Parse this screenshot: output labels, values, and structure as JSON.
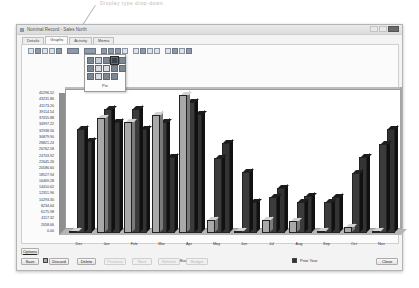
{
  "callout": {
    "text": "Display type drop-down"
  },
  "window": {
    "title": "Nominal Record - Sales North"
  },
  "tabs": [
    {
      "label": "Details",
      "active": false
    },
    {
      "label": "Graphs",
      "active": true
    },
    {
      "label": "Activity",
      "active": false
    },
    {
      "label": "Memo",
      "active": false
    }
  ],
  "toolbar": {
    "groups": [
      [
        "print-icon",
        "save-icon",
        "copy-icon",
        "cut-icon",
        "export-icon"
      ],
      [
        "chart-type-dropdown"
      ],
      [
        "color-dropdown"
      ],
      [
        "rotate-icon",
        "3d-icon",
        "grid-icon",
        "zoom-icon"
      ],
      [
        "legend-icon",
        "table-icon",
        "axis-icon",
        "label-icon"
      ],
      [
        "title-icon",
        "font-icon",
        "filter-icon",
        "properties-icon"
      ]
    ]
  },
  "chart_type_menu": {
    "hovered_label": "Pie",
    "items": [
      "bar-chart",
      "line-chart",
      "area-chart",
      "pie-chart",
      "3d-bar-chart",
      "stacked-bar-chart",
      "scatter-chart",
      "step-chart",
      "doughnut-chart",
      "column-chart",
      "gantt-chart",
      "step-line-chart",
      "hilo-chart",
      "polar-chart"
    ]
  },
  "chart_data": {
    "type": "bar",
    "title": "",
    "xlabel": "",
    "ylabel": "",
    "ylim": [
      0,
      45296.52
    ],
    "grid": false,
    "legend_position": "bottom",
    "yticks": [
      "45296.52",
      "43231.86",
      "41173.20",
      "39114.54",
      "37055.88",
      "34997.22",
      "32938.56",
      "30879.90",
      "28821.24",
      "26762.58",
      "24703.92",
      "22645.26",
      "20586.60",
      "18527.94",
      "16469.28",
      "14410.62",
      "12351.96",
      "10293.30",
      "8234.64",
      "6175.98",
      "4117.32",
      "2058.66",
      "0.00"
    ],
    "categories": [
      "Dec",
      "Jan",
      "Feb",
      "Mar",
      "Apr",
      "May",
      "Jun",
      "Jul",
      "Aug",
      "Sep",
      "Oct",
      "Nov"
    ],
    "series": [
      {
        "name": "Actuals",
        "color": "#a9a9a9",
        "values": [
          500,
          37800,
          36500,
          38800,
          45300,
          4200,
          600,
          4200,
          3900,
          600,
          1900,
          600
        ]
      },
      {
        "name": "Budgets",
        "color": "#3b3b3b",
        "values": [
          34300,
          40800,
          40800,
          36500,
          43000,
          24500,
          20000,
          11900,
          10300,
          10300,
          19700,
          29100
        ]
      },
      {
        "name": "Prior Year",
        "color": "#333333",
        "values": [
          30100,
          36500,
          34300,
          24800,
          39100,
          29400,
          10300,
          14800,
          12300,
          11900,
          24800,
          34000
        ]
      }
    ]
  },
  "legend": [
    {
      "label": "Actuals"
    },
    {
      "label": "Budgets"
    },
    {
      "label": "Prior Year"
    }
  ],
  "buttons": {
    "options": "Options",
    "save": "Save",
    "discard": "Discard",
    "delete": "Delete",
    "previous": "Previous",
    "next": "Next",
    "refresh": "Refresh",
    "budget": "Budget",
    "close": "Close"
  }
}
